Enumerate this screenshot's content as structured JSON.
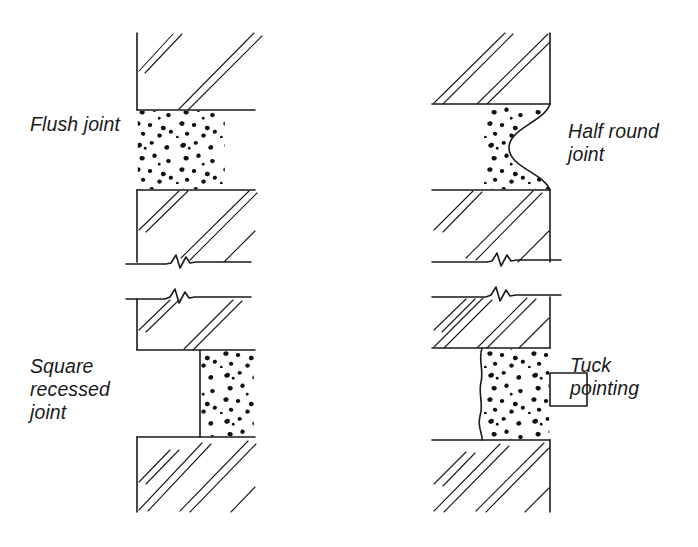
{
  "figure": {
    "stroke_color": "#1a1a1a",
    "fill_color": "#ffffff",
    "background": "#ffffff"
  },
  "labels": {
    "flush": "Flush joint",
    "half_round": "Half round\njoint",
    "square_recessed": "Square\nrecessed\njoint",
    "tuck_pointing": "Tuck\npointing"
  },
  "details": [
    {
      "id": "flush-joint",
      "name": "Flush joint",
      "position": "top-left",
      "joint_profile": "flush",
      "description": "Mortar finished flush with the face of the brickwork",
      "mortar_texture": "stipple",
      "wall_face_x": 137,
      "joint_top_y": 110,
      "joint_bottom_y": 190
    },
    {
      "id": "half-round-joint",
      "name": "Half round joint",
      "position": "top-right",
      "joint_profile": "concave-half-round",
      "description": "Mortar tooled to a concave half round recess",
      "mortar_texture": "stipple",
      "wall_face_x": 550,
      "joint_top_y": 104,
      "joint_bottom_y": 190
    },
    {
      "id": "square-recessed-joint",
      "name": "Square recessed joint",
      "position": "bottom-left",
      "joint_profile": "square-recessed",
      "description": "Mortar raked back square behind the face of the brickwork",
      "mortar_texture": "stipple",
      "wall_face_x": 137,
      "recess_face_x": 200,
      "joint_top_y": 350,
      "joint_bottom_y": 437
    },
    {
      "id": "tuck-pointing",
      "name": "Tuck pointing",
      "position": "bottom-right",
      "joint_profile": "tuck-pointed",
      "description": "Flush mortar with a raised projecting lime ribbon",
      "mortar_texture": "stipple",
      "wall_face_x": 550,
      "joint_top_y": 348,
      "joint_bottom_y": 440,
      "ribbon": {
        "name": "tuck ribbon",
        "x": 550,
        "y": 373,
        "width": 37,
        "height": 33
      }
    }
  ],
  "graphic_elements": {
    "break_line": "zigzag break line",
    "hatching": "paired diagonal section hatch lines",
    "bed_joint": "horizontal bed joint line",
    "wall_face": "vertical wall face line"
  }
}
